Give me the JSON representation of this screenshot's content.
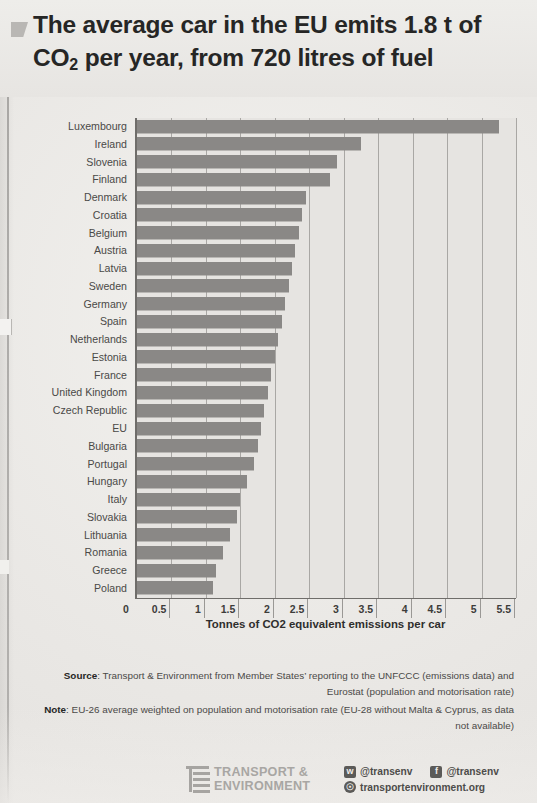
{
  "title": {
    "line1_a": "The average car in the EU emits 1.8 t of",
    "line2_a": "CO",
    "line2_sub": "2",
    "line2_b": " per year, from 720 litres of fuel"
  },
  "axis": {
    "x_title": "Tonnes of CO2 equivalent emissions per car"
  },
  "notes": {
    "source_label": "Source",
    "source_text": ": Transport & Environment from Member States’ reporting to the UNFCCC (emissions data) and Eurostat (population and motorisation rate)",
    "note_label": "Note",
    "note_text": ": EU-26 average weighted on population and motorisation rate (EU-28 without Malta & Cyprus, as data not available)"
  },
  "footer": {
    "logo_line1": "TRANSPORT &",
    "logo_line2": "ENVIRONMENT",
    "twitter_handle": "@transenv",
    "facebook_handle": "@transenv",
    "website": "transportenvironment.org"
  },
  "colors": {
    "bar": "#8a8886",
    "plot_background": "#e6e4e1",
    "page_background": "#eceae7",
    "gridline": "#a9a7a4",
    "text": "#3a3a3a"
  },
  "chart_data": {
    "type": "bar",
    "orientation": "horizontal",
    "title": "The average car in the EU emits 1.8 t of CO2 per year, from 720 litres of fuel",
    "xlabel": "Tonnes of CO2 equivalent emissions per car",
    "ylabel": "",
    "xlim": [
      0,
      5.5
    ],
    "xticks": [
      0,
      0.5,
      1,
      1.5,
      2,
      2.5,
      3,
      3.5,
      4,
      4.5,
      5,
      5.5
    ],
    "xtick_labels": [
      "0",
      "0.5",
      "1",
      "1.5",
      "2",
      "2.5",
      "3",
      "3.5",
      "4",
      "4.5",
      "5",
      "5.5"
    ],
    "grid": true,
    "legend": false,
    "categories": [
      "Luxembourg",
      "Ireland",
      "Slovenia",
      "Finland",
      "Denmark",
      "Croatia",
      "Belgium",
      "Austria",
      "Latvia",
      "Sweden",
      "Germany",
      "Spain",
      "Netherlands",
      "Estonia",
      "France",
      "United Kingdom",
      "Czech Republic",
      "EU",
      "Bulgaria",
      "Portugal",
      "Hungary",
      "Italy",
      "Slovakia",
      "Lithuania",
      "Romania",
      "Greece",
      "Poland"
    ],
    "values": [
      5.25,
      3.25,
      2.9,
      2.8,
      2.45,
      2.4,
      2.35,
      2.3,
      2.25,
      2.2,
      2.15,
      2.1,
      2.05,
      2.0,
      1.95,
      1.9,
      1.85,
      1.8,
      1.75,
      1.7,
      1.6,
      1.5,
      1.45,
      1.35,
      1.25,
      1.15,
      1.1
    ],
    "series_name": "Tonnes of CO2 equivalent emissions per car"
  }
}
